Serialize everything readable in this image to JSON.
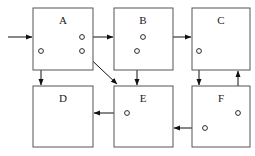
{
  "diagram": {
    "canvas": {
      "width": 255,
      "height": 156,
      "background": "#ffffff"
    },
    "colors": {
      "box_border": "#555555",
      "box_fill": "#ffffff",
      "dashed_line": "#9a9a9a",
      "connector": "#111111",
      "port_stroke": "#2a2a2a",
      "label_text": "#1a1a1a"
    },
    "boxes": [
      {
        "id": "A",
        "label": "A",
        "x": 33,
        "y": 8,
        "w": 60,
        "h": 62,
        "label_x": 63,
        "label_y": 24
      },
      {
        "id": "B",
        "label": "B",
        "x": 114,
        "y": 8,
        "w": 59,
        "h": 62,
        "label_x": 143,
        "label_y": 24
      },
      {
        "id": "C",
        "label": "C",
        "x": 192,
        "y": 8,
        "w": 58,
        "h": 62,
        "label_x": 221,
        "label_y": 24
      },
      {
        "id": "D",
        "label": "D",
        "x": 33,
        "y": 86,
        "w": 60,
        "h": 61,
        "label_x": 63,
        "label_y": 102
      },
      {
        "id": "E",
        "label": "E",
        "x": 114,
        "y": 86,
        "w": 59,
        "h": 61,
        "label_x": 143,
        "label_y": 102
      },
      {
        "id": "F",
        "label": "F",
        "x": 192,
        "y": 86,
        "w": 58,
        "h": 61,
        "label_x": 221,
        "label_y": 102
      }
    ],
    "dashed_lines": [
      {
        "box": "A",
        "slot": "upper",
        "x1": 39,
        "y1": 37,
        "x2": 87
      },
      {
        "box": "A",
        "slot": "lower",
        "x1": 39,
        "y1": 51,
        "x2": 87
      },
      {
        "box": "B",
        "slot": "upper",
        "x1": 120,
        "y1": 37,
        "x2": 167
      },
      {
        "box": "B",
        "slot": "lower",
        "x1": 120,
        "y1": 51,
        "x2": 167
      },
      {
        "box": "C",
        "slot": "upper",
        "x1": 198,
        "y1": 37,
        "x2": 244
      },
      {
        "box": "C",
        "slot": "lower",
        "x1": 198,
        "y1": 51,
        "x2": 244
      },
      {
        "box": "D",
        "slot": "upper",
        "x1": 39,
        "y1": 113,
        "x2": 87
      },
      {
        "box": "D",
        "slot": "lower",
        "x1": 39,
        "y1": 128,
        "x2": 87
      },
      {
        "box": "E",
        "slot": "upper",
        "x1": 120,
        "y1": 113,
        "x2": 167
      },
      {
        "box": "E",
        "slot": "lower",
        "x1": 120,
        "y1": 128,
        "x2": 167
      },
      {
        "box": "F",
        "slot": "upper",
        "x1": 198,
        "y1": 113,
        "x2": 244
      },
      {
        "box": "F",
        "slot": "lower",
        "x1": 198,
        "y1": 128,
        "x2": 244
      }
    ],
    "ports": [
      {
        "id": "A-upper-right",
        "box": "A",
        "cx": 82,
        "cy": 37,
        "r": 2.4
      },
      {
        "id": "A-lower-left",
        "box": "A",
        "cx": 41,
        "cy": 51,
        "r": 2.4
      },
      {
        "id": "A-lower-right",
        "box": "A",
        "cx": 82,
        "cy": 51,
        "r": 2.4
      },
      {
        "id": "B-upper-mid",
        "box": "B",
        "cx": 143,
        "cy": 37,
        "r": 2.4
      },
      {
        "id": "B-lower-mid",
        "box": "B",
        "cx": 137,
        "cy": 51,
        "r": 2.4
      },
      {
        "id": "C-lower-left",
        "box": "C",
        "cx": 199,
        "cy": 51,
        "r": 2.4
      },
      {
        "id": "E-upper-left",
        "box": "E",
        "cx": 127,
        "cy": 113,
        "r": 2.4
      },
      {
        "id": "F-upper-right",
        "box": "F",
        "cx": 238,
        "cy": 113,
        "r": 2.4
      },
      {
        "id": "F-lower-left",
        "box": "F",
        "cx": 205,
        "cy": 128,
        "r": 2.4
      }
    ],
    "connections": [
      {
        "id": "input-to-A",
        "from": "external-input",
        "to": "A",
        "kind": "horizontal-right",
        "points": "8,37 32,37"
      },
      {
        "id": "A-to-B",
        "from": "A-upper-right",
        "to": "B",
        "kind": "horizontal-right",
        "points": "82,37 113,37"
      },
      {
        "id": "B-to-C",
        "from": "B-upper-mid",
        "to": "C",
        "kind": "horizontal-right",
        "points": "143,37 191,37"
      },
      {
        "id": "A-to-D",
        "from": "A-lower-left",
        "to": "D",
        "kind": "vertical-down",
        "points": "41,51 41,85"
      },
      {
        "id": "B-to-E",
        "from": "B-lower-mid",
        "to": "E",
        "kind": "vertical-down",
        "points": "137,51 137,85"
      },
      {
        "id": "C-to-F",
        "from": "C-lower-left",
        "to": "F",
        "kind": "vertical-down",
        "points": "199,51 199,85"
      },
      {
        "id": "A-to-E",
        "from": "A-lower-right",
        "to": "E",
        "kind": "diagonal-down",
        "points": "83,52 117,84"
      },
      {
        "id": "F-to-C",
        "from": "F-upper-right",
        "to": "C",
        "kind": "vertical-up",
        "points": "238,113 238,71"
      },
      {
        "id": "E-to-D",
        "from": "E-upper-left",
        "to": "D",
        "kind": "horizontal-left",
        "points": "127,113 94,113"
      },
      {
        "id": "F-to-E",
        "from": "F-lower-left",
        "to": "E",
        "kind": "horizontal-left",
        "points": "205,128 174,128"
      }
    ]
  }
}
